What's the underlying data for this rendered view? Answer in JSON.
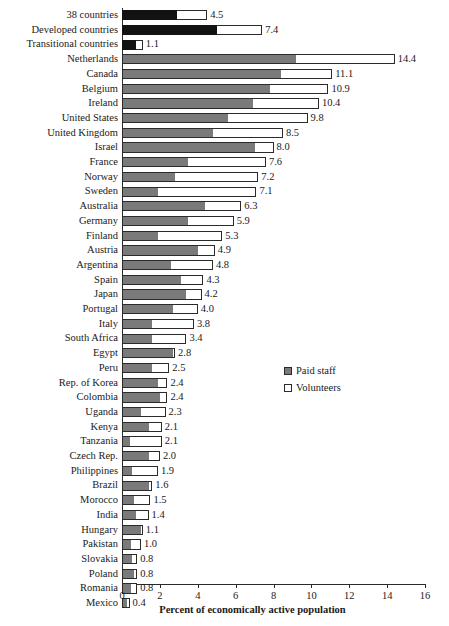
{
  "chart_data": {
    "type": "bar",
    "orientation": "horizontal",
    "stacked": true,
    "title": "",
    "xlabel": "Percent of economically active population",
    "ylabel": "",
    "xlim": [
      0,
      16
    ],
    "xticks": [
      0,
      2,
      4,
      6,
      8,
      10,
      12,
      14,
      16
    ],
    "grid": false,
    "legend_position": "middle-right",
    "legend": [
      {
        "name": "Paid staff",
        "color": "#7a7a7a"
      },
      {
        "name": "Volunteers",
        "color": "#ffffff"
      }
    ],
    "categories": [
      "38 countries",
      "Developed countries",
      "Transitional countries",
      "Netherlands",
      "Canada",
      "Belgium",
      "Ireland",
      "United States",
      "United Kingdom",
      "Israel",
      "France",
      "Norway",
      "Sweden",
      "Australia",
      "Germany",
      "Finland",
      "Austria",
      "Argentina",
      "Spain",
      "Japan",
      "Portugal",
      "Italy",
      "South Africa",
      "Egypt",
      "Peru",
      "Rep. of Korea",
      "Colombia",
      "Uganda",
      "Kenya",
      "Tanzania",
      "Czech Rep.",
      "Philippines",
      "Brazil",
      "Morocco",
      "India",
      "Hungary",
      "Pakistan",
      "Slovakia",
      "Poland",
      "Romania",
      "Mexico"
    ],
    "series": [
      {
        "name": "Paid staff",
        "values": [
          2.9,
          5.0,
          0.75,
          9.2,
          8.4,
          7.8,
          6.9,
          5.6,
          4.8,
          7.0,
          3.5,
          2.8,
          1.9,
          4.4,
          3.5,
          1.9,
          4.0,
          2.6,
          3.1,
          3.4,
          2.7,
          1.6,
          1.6,
          2.7,
          1.6,
          1.9,
          2.0,
          1.0,
          1.4,
          0.4,
          1.4,
          0.55,
          1.45,
          0.65,
          0.75,
          1.0,
          0.5,
          0.55,
          0.62,
          0.45,
          0.25
        ]
      },
      {
        "name": "Volunteers",
        "values": [
          1.6,
          2.4,
          0.35,
          5.2,
          2.7,
          3.1,
          3.5,
          4.2,
          3.7,
          1.0,
          4.1,
          4.4,
          5.2,
          1.9,
          2.4,
          3.4,
          0.9,
          2.2,
          1.2,
          0.8,
          1.3,
          2.2,
          1.8,
          0.1,
          0.9,
          0.5,
          0.4,
          1.3,
          0.7,
          1.7,
          0.6,
          1.35,
          0.15,
          0.85,
          0.65,
          0.1,
          0.5,
          0.25,
          0.18,
          0.35,
          0.15
        ]
      }
    ],
    "totals": [
      4.5,
      7.4,
      1.1,
      14.4,
      11.1,
      10.9,
      10.4,
      9.8,
      8.5,
      8.0,
      7.6,
      7.2,
      7.1,
      6.3,
      5.9,
      5.3,
      4.9,
      4.8,
      4.3,
      4.2,
      4.0,
      3.8,
      3.4,
      2.8,
      2.5,
      2.4,
      2.4,
      2.3,
      2.1,
      2.1,
      2.0,
      1.9,
      1.6,
      1.5,
      1.4,
      1.1,
      1.0,
      0.8,
      0.8,
      0.8,
      0.4
    ],
    "value_labels": [
      "4.5",
      "7.4",
      "1.1",
      "14.4",
      "11.1",
      "10.9",
      "10.4",
      "9.8",
      "8.5",
      "8.0",
      "7.6",
      "7.2",
      "7.1",
      "6.3",
      "5.9",
      "5.3",
      "4.9",
      "4.8",
      "4.3",
      "4.2",
      "4.0",
      "3.8",
      "3.4",
      "2.8",
      "2.5",
      "2.4",
      "2.4",
      "2.3",
      "2.1",
      "2.1",
      "2.0",
      "1.9",
      "1.6",
      "1.5",
      "1.4",
      "1.1",
      "1.0",
      "0.8",
      "0.8",
      "0.8",
      "0.4"
    ],
    "highlight_rows": [
      0,
      1,
      2
    ],
    "highlight_color": "#121212",
    "tick_labels": [
      "0",
      "2",
      "4",
      "6",
      "8",
      "10",
      "12",
      "14",
      "16"
    ]
  }
}
